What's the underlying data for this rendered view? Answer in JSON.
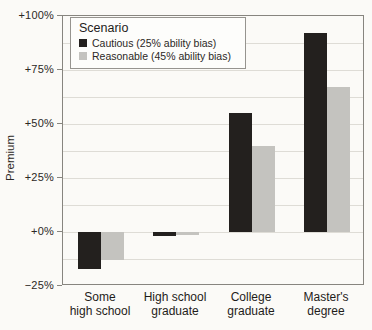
{
  "figure": {
    "background": "#fbfaf7",
    "frame_color": "#87857f",
    "grid_color": "#dedcd6",
    "text_color": "#24211e"
  },
  "chart_data": {
    "type": "bar",
    "title": "",
    "xlabel": "",
    "ylabel": "Premium",
    "ylim": [
      -25,
      100
    ],
    "grid": "on",
    "grid_interval": 12.5,
    "legend_position": "top-left-inside",
    "legend_title": "Scenario",
    "categories": [
      "Some high school",
      "High school graduate",
      "College graduate",
      "Master's degree"
    ],
    "category_label_lines": [
      [
        "Some",
        "high school"
      ],
      [
        "High school",
        "graduate"
      ],
      [
        "College",
        "graduate"
      ],
      [
        "Master's",
        "degree"
      ]
    ],
    "yticks": [
      {
        "value": 100,
        "label": "+100%"
      },
      {
        "value": 75,
        "label": "+75%"
      },
      {
        "value": 50,
        "label": "+50%"
      },
      {
        "value": 25,
        "label": "+25%"
      },
      {
        "value": 0,
        "label": "+0%"
      },
      {
        "value": -25,
        "label": "−25%"
      }
    ],
    "series": [
      {
        "name": "Cautious (25% ability bias)",
        "color": "#23201e",
        "values": [
          -17,
          -2,
          55,
          92
        ]
      },
      {
        "name": "Reasonable (45% ability bias)",
        "color": "#c4c3bf",
        "values": [
          -13,
          -1.5,
          40,
          67
        ]
      }
    ]
  }
}
